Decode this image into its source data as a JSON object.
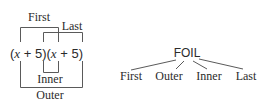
{
  "foil_bracket_diagram": {
    "expression": {
      "open1": "(",
      "var1": "x",
      "op1": " + 5)(",
      "var2": "x",
      "op2": " + 5)"
    },
    "labels": {
      "first": "First",
      "last": "Last",
      "inner": "Inner",
      "outer": "Outer"
    }
  },
  "foil_tree_diagram": {
    "root": "FOIL",
    "children": [
      "First",
      "Outer",
      "Inner",
      "Last"
    ]
  },
  "colors": {
    "text": "#2b2b2b",
    "lines": "#5a5a5a",
    "background": "#ffffff"
  }
}
